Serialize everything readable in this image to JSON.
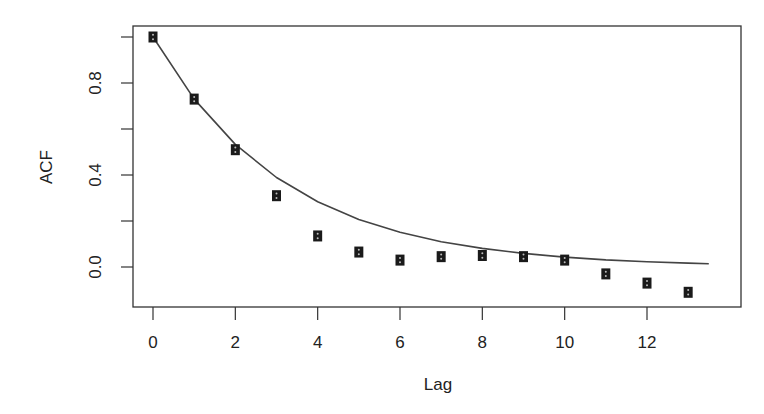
{
  "chart_data": {
    "type": "scatter",
    "title": "",
    "xlabel": "Lag",
    "ylabel": "ACF",
    "xlim": [
      -0.5,
      13.5
    ],
    "ylim": [
      -0.17,
      1.05
    ],
    "grid": false,
    "legend": null,
    "x_ticks": [
      0,
      2,
      4,
      6,
      8,
      10,
      12
    ],
    "x_tick_labels": [
      "0",
      "2",
      "4",
      "6",
      "8",
      "10",
      "12"
    ],
    "y_ticks": [
      0.0,
      0.2,
      0.4,
      0.6,
      0.8,
      1.0
    ],
    "y_tick_labels": [
      "0.0",
      "",
      "0.4",
      "",
      "0.8",
      ""
    ],
    "series": [
      {
        "name": "sample ACF",
        "type": "scatter",
        "marker": "square",
        "x": [
          0,
          1,
          2,
          3,
          4,
          5,
          6,
          7,
          8,
          9,
          10,
          11,
          12,
          13
        ],
        "values": [
          1.0,
          0.73,
          0.51,
          0.31,
          0.135,
          0.065,
          0.03,
          0.045,
          0.05,
          0.045,
          0.03,
          -0.03,
          -0.07,
          -0.11
        ]
      },
      {
        "name": "theoretical ACF",
        "type": "line",
        "formula": "0.73^lag",
        "x": [
          0,
          1,
          2,
          3,
          4,
          5,
          6,
          7,
          8,
          9,
          10,
          11,
          12,
          13,
          13.5
        ],
        "values": [
          1.0,
          0.73,
          0.533,
          0.389,
          0.284,
          0.207,
          0.151,
          0.11,
          0.081,
          0.059,
          0.043,
          0.031,
          0.023,
          0.017,
          0.014
        ]
      }
    ]
  }
}
